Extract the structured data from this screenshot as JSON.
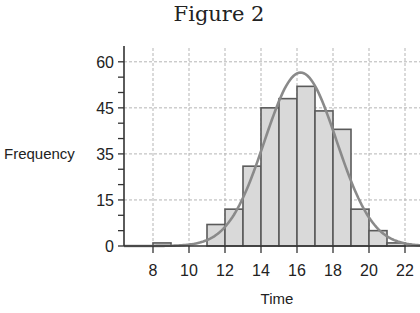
{
  "chart_data": {
    "type": "bar",
    "subtype": "histogram_with_normal_curve",
    "title": "Figure 2",
    "xlabel": "Time",
    "ylabel": "Frequency",
    "x_ticks": [
      8,
      10,
      12,
      14,
      16,
      18,
      20,
      22
    ],
    "y_ticks": [
      0,
      15,
      30,
      45,
      60
    ],
    "y_tick_labels": [
      "0",
      "15",
      "35",
      "45",
      "60"
    ],
    "xlim": [
      6.3,
      23.7
    ],
    "ylim": [
      0,
      60
    ],
    "grid": true,
    "bin_width": 1,
    "bins": [
      {
        "start": 8,
        "end": 9,
        "value": 1
      },
      {
        "start": 9,
        "end": 10,
        "value": 0
      },
      {
        "start": 10,
        "end": 11,
        "value": 0
      },
      {
        "start": 11,
        "end": 12,
        "value": 7
      },
      {
        "start": 12,
        "end": 13,
        "value": 12
      },
      {
        "start": 13,
        "end": 14,
        "value": 26
      },
      {
        "start": 14,
        "end": 15,
        "value": 45
      },
      {
        "start": 15,
        "end": 16,
        "value": 48
      },
      {
        "start": 16,
        "end": 17,
        "value": 52
      },
      {
        "start": 17,
        "end": 18,
        "value": 44
      },
      {
        "start": 18,
        "end": 19,
        "value": 38
      },
      {
        "start": 19,
        "end": 20,
        "value": 12
      },
      {
        "start": 20,
        "end": 21,
        "value": 5
      },
      {
        "start": 21,
        "end": 22,
        "value": 1
      }
    ],
    "curve": {
      "type": "normal",
      "mean": 16.2,
      "sd": 2.0,
      "peak": 56.5
    },
    "colors": {
      "bar_fill": "#d9d9d9",
      "bar_stroke": "#5a5a5a",
      "curve": "#8a8a8a",
      "grid": "#b5b5b5",
      "axis": "#333333"
    }
  }
}
